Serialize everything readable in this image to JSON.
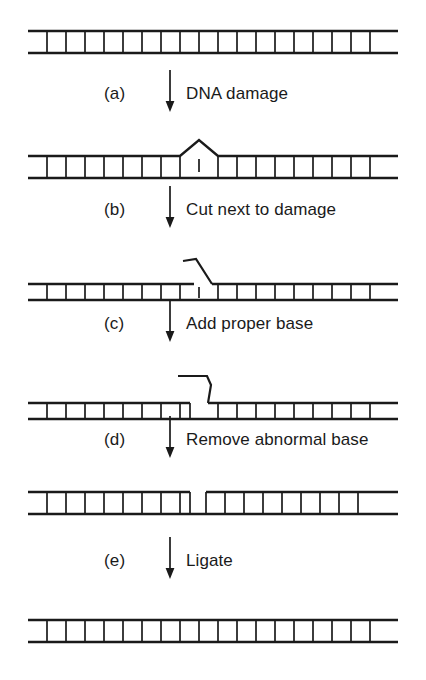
{
  "figure": {
    "ink_color": "#1a1a1a",
    "background_color": "#ffffff"
  },
  "steps": [
    {
      "index": "(a)",
      "label": "DNA damage",
      "arrow": "down-arrow-icon"
    },
    {
      "index": "(b)",
      "label": "Cut next to damage",
      "arrow": "down-arrow-icon"
    },
    {
      "index": "(c)",
      "label": "Add proper base",
      "arrow": "down-arrow-icon"
    },
    {
      "index": "(d)",
      "label": "Remove abnormal base",
      "arrow": "down-arrow-icon"
    },
    {
      "index": "(e)",
      "label": "Ligate",
      "arrow": "down-arrow-icon"
    }
  ],
  "stages": [
    {
      "name": "intact-duplex",
      "caption": "Intact DNA duplex",
      "rungs": 19,
      "state": "intact"
    },
    {
      "name": "damaged-duplex",
      "caption": "Duplex with lesion bump in top strand",
      "rungs": 19,
      "state": "damaged",
      "lesion_position": 9
    },
    {
      "name": "incised-duplex",
      "caption": "Top strand cut next to damage, flap lifted",
      "rungs": 19,
      "state": "incised",
      "lesion_position": 9
    },
    {
      "name": "repaired-patch-duplex",
      "caption": "Proper base added, abnormal base on displaced flap",
      "rungs": 19,
      "state": "flap-extended",
      "lesion_position": 9
    },
    {
      "name": "nicked-duplex",
      "caption": "Abnormal base removed leaving a nick in top strand",
      "rungs": 19,
      "state": "nicked",
      "nick_position": 9
    },
    {
      "name": "ligated-duplex",
      "caption": "Ligated, fully repaired duplex",
      "rungs": 19,
      "state": "intact"
    }
  ],
  "geometry": {
    "duplex_left": 28,
    "duplex_right": 398,
    "duplex_height": 26,
    "stage_tops": [
      28,
      137,
      253,
      366,
      489,
      617
    ],
    "step_tops": [
      66,
      182,
      296,
      412,
      533
    ]
  }
}
